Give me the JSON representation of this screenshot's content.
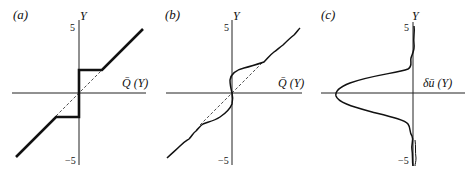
{
  "figure": {
    "panels": [
      {
        "id": "a",
        "label": "(a)",
        "y_axis_label": "Y",
        "x_axis_label": "Q̄ (Y)",
        "y_tick_top": "5",
        "y_tick_bottom": "−5",
        "description": "Piecewise-linear staircase: diagonal Q=Y outside a band, flat steps near origin, dashed diagonal reference"
      },
      {
        "id": "b",
        "label": "(b)",
        "y_axis_label": "Y",
        "x_axis_label": "Q̄ (Y)",
        "y_tick_top": "5",
        "y_tick_bottom": "−5",
        "description": "Smoothed wavy profile following diagonal, bulging left above origin and right below; dashed diagonal reference"
      },
      {
        "id": "c",
        "label": "(c)",
        "y_axis_label": "Y",
        "x_axis_label": "δū (Y)",
        "y_tick_top": "5",
        "y_tick_bottom": "−5",
        "description": "Bell-shaped negative velocity deficit profile centered at Y=0 with small wiggles at tails"
      }
    ]
  }
}
